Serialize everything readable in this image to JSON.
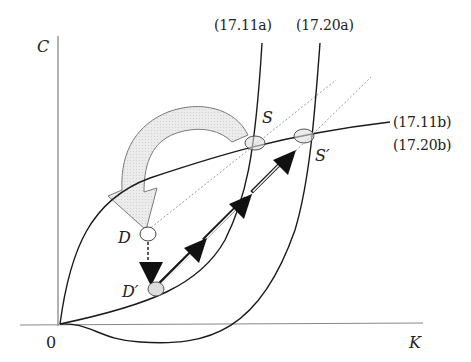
{
  "diagram": {
    "axes": {
      "y_label": "C",
      "x_label": "K",
      "origin_label": "0"
    },
    "curves": {
      "c_dot_zero_old": "(17.11a)",
      "c_dot_zero_new": "(17.20a)",
      "k_dot_zero_old": "(17.11b)",
      "k_dot_zero_new": "(17.20b)"
    },
    "points": {
      "old_steady_state": "S",
      "new_steady_state": "S′",
      "jump_start": "D",
      "jump_end": "D′"
    },
    "colors": {
      "curve": "#1a1a1a",
      "axis": "#555555",
      "shift_arrow_fill": "#e6e6e6",
      "shift_arrow_stroke": "#777777",
      "saddle_path_dotted": "#999999",
      "marker_fill": "#dddddd"
    }
  }
}
